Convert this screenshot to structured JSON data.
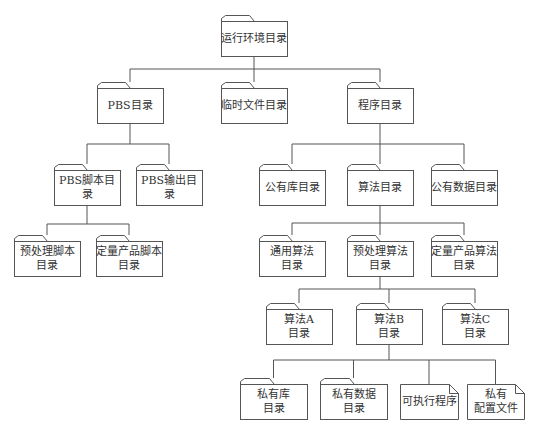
{
  "diagram": {
    "type": "directory-tree",
    "colors": {
      "stroke": "#555555",
      "fill": "#ffffff",
      "text": "#333333"
    },
    "nodes": [
      {
        "id": "root",
        "label": "运行环境目录",
        "kind": "folder",
        "x": 221,
        "y": 21,
        "w": 66,
        "h": 35
      },
      {
        "id": "pbs",
        "label": "PBS目录",
        "kind": "folder",
        "x": 97,
        "y": 88,
        "w": 66,
        "h": 35
      },
      {
        "id": "tmp",
        "label": "临时文件目录",
        "kind": "folder",
        "x": 221,
        "y": 88,
        "w": 66,
        "h": 35
      },
      {
        "id": "prog",
        "label": "程序目录",
        "kind": "folder",
        "x": 347,
        "y": 88,
        "w": 66,
        "h": 35
      },
      {
        "id": "pbs_script",
        "label": "PBS脚本目录",
        "kind": "folder",
        "x": 54,
        "y": 170,
        "w": 66,
        "h": 35
      },
      {
        "id": "pbs_out",
        "label": "PBS输出目录",
        "kind": "folder",
        "x": 136,
        "y": 170,
        "w": 66,
        "h": 35
      },
      {
        "id": "pub_lib",
        "label": "公有库目录",
        "kind": "folder",
        "x": 259,
        "y": 170,
        "w": 66,
        "h": 35
      },
      {
        "id": "algo",
        "label": "算法目录",
        "kind": "folder",
        "x": 347,
        "y": 170,
        "w": 66,
        "h": 35
      },
      {
        "id": "pub_data",
        "label": "公有数据目录",
        "kind": "folder",
        "x": 431,
        "y": 170,
        "w": 66,
        "h": 35
      },
      {
        "id": "pre_script",
        "label": "预处理脚本\n目录",
        "kind": "folder",
        "x": 14,
        "y": 241,
        "w": 66,
        "h": 35
      },
      {
        "id": "quant_script",
        "label": "定量产品脚本\n目录",
        "kind": "folder",
        "x": 96,
        "y": 241,
        "w": 66,
        "h": 35
      },
      {
        "id": "gen_algo",
        "label": "通用算法\n目录",
        "kind": "folder",
        "x": 259,
        "y": 241,
        "w": 66,
        "h": 35
      },
      {
        "id": "pre_algo",
        "label": "预处理算法\n目录",
        "kind": "folder",
        "x": 347,
        "y": 241,
        "w": 66,
        "h": 35
      },
      {
        "id": "quant_algo",
        "label": "定量产品算法\n目录",
        "kind": "folder",
        "x": 431,
        "y": 241,
        "w": 66,
        "h": 35
      },
      {
        "id": "algo_a",
        "label": "算法A\n目录",
        "kind": "folder",
        "x": 266,
        "y": 309,
        "w": 66,
        "h": 35
      },
      {
        "id": "algo_b",
        "label": "算法B\n目录",
        "kind": "folder",
        "x": 356,
        "y": 309,
        "w": 66,
        "h": 35
      },
      {
        "id": "algo_c",
        "label": "算法C\n目录",
        "kind": "folder",
        "x": 442,
        "y": 309,
        "w": 66,
        "h": 35
      },
      {
        "id": "priv_lib",
        "label": "私有库\n目录",
        "kind": "folder",
        "x": 240,
        "y": 384,
        "w": 67,
        "h": 35
      },
      {
        "id": "priv_data",
        "label": "私有数据\n目录",
        "kind": "folder",
        "x": 320,
        "y": 384,
        "w": 67,
        "h": 35
      },
      {
        "id": "exe",
        "label": "可执行程序",
        "kind": "file",
        "x": 400,
        "y": 384,
        "w": 58,
        "h": 35
      },
      {
        "id": "priv_cfg",
        "label": "私有\n配置文件",
        "kind": "file",
        "x": 467,
        "y": 384,
        "w": 57,
        "h": 35
      }
    ],
    "buses": [
      {
        "parent": "root",
        "y": 69,
        "children": [
          "pbs",
          "tmp",
          "prog"
        ]
      },
      {
        "parent": "pbs",
        "y": 144,
        "children": [
          "pbs_script",
          "pbs_out"
        ]
      },
      {
        "parent": "prog",
        "y": 144,
        "children": [
          "pub_lib",
          "algo",
          "pub_data"
        ]
      },
      {
        "parent": "pbs_script",
        "y": 224,
        "children": [
          "pre_script",
          "quant_script"
        ]
      },
      {
        "parent": "algo",
        "y": 223,
        "children": [
          "gen_algo",
          "pre_algo",
          "quant_algo"
        ]
      },
      {
        "parent": "pre_algo",
        "y": 289,
        "children": [
          "algo_a",
          "algo_b",
          "algo_c"
        ]
      },
      {
        "parent": "algo_b",
        "y": 360,
        "children": [
          "priv_lib",
          "priv_data",
          "exe",
          "priv_cfg"
        ]
      }
    ]
  }
}
